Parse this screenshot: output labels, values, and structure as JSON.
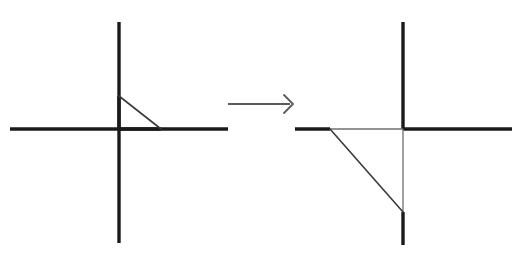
{
  "figure": {
    "title": "Right triangle reflected through the origin",
    "canvas": {
      "width": 527,
      "height": 267,
      "background": "#ffffff"
    },
    "colors": {
      "axis": "#1a1a1a",
      "triangle_stroke": "#3a3a3a",
      "overlay_leg": "#6f6f6f",
      "arrow": "#5a5a5a",
      "background": "#ffffff"
    },
    "stroke_widths": {
      "axis": 3.4,
      "triangle": 1.6,
      "overlay_leg": 1.3,
      "arrow": 1.8
    }
  },
  "panels": [
    {
      "id": "source-panel",
      "label": "Original triangle",
      "origin": {
        "x": 119,
        "y": 129
      },
      "axes": {
        "vertical": {
          "x": 119,
          "y1": 22,
          "y2": 243
        },
        "horizontal": {
          "y": 129,
          "x1": 10,
          "x2": 228
        }
      },
      "triangle": {
        "label": "original-triangle",
        "quadrant": "I",
        "vertices": [
          {
            "name": "top-vertex-on-y-axis",
            "x": 119,
            "y": 96
          },
          {
            "name": "origin-vertex",
            "x": 119,
            "y": 129
          },
          {
            "name": "right-vertex-on-x-axis",
            "x": 161,
            "y": 129
          }
        ],
        "hypotenuse": {
          "x1": 119,
          "y1": 96,
          "x2": 161,
          "y2": 129
        },
        "vertical_leg": {
          "x": 119,
          "y1": 96,
          "y2": 129
        },
        "horizontal_leg": {
          "y": 129,
          "x1": 119,
          "x2": 161
        },
        "leg_lengths": {
          "vertical": 33,
          "horizontal": 42
        }
      }
    },
    {
      "id": "target-panel",
      "label": "Transformed triangle",
      "origin": {
        "x": 403,
        "y": 129
      },
      "axes": {
        "vertical": {
          "x": 403,
          "y1": 22,
          "y2": 245
        },
        "horizontal": {
          "y": 129,
          "x1": 295,
          "x2": 512
        }
      },
      "triangle": {
        "label": "transformed-triangle",
        "quadrant": "III",
        "vertices": [
          {
            "name": "left-vertex-on-x-axis",
            "x": 330,
            "y": 129
          },
          {
            "name": "origin-vertex",
            "x": 403,
            "y": 129
          },
          {
            "name": "bottom-vertex-on-y-axis",
            "x": 403,
            "y": 212
          }
        ],
        "hypotenuse": {
          "x1": 330,
          "y1": 129,
          "x2": 403,
          "y2": 212
        },
        "horizontal_leg": {
          "y": 129,
          "x1": 330,
          "x2": 403
        },
        "vertical_leg": {
          "x": 403,
          "y1": 129,
          "y2": 212
        },
        "leg_lengths": {
          "horizontal": 73,
          "vertical": 83
        }
      }
    }
  ],
  "arrow": {
    "label": "transformation-arrow",
    "style": "open-chevron",
    "shaft": {
      "x1": 228,
      "y": 104,
      "x2": 290
    },
    "head": {
      "tip_x": 293,
      "tip_y": 104,
      "size": 9
    }
  }
}
